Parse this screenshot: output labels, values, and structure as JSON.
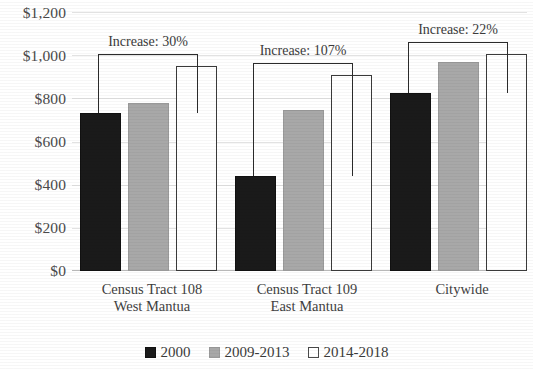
{
  "chart_data": {
    "type": "bar",
    "title": "",
    "subtitle": "",
    "xlabel": "",
    "ylabel": "",
    "ylim": [
      0,
      1200
    ],
    "ytick_step": 200,
    "ytick_labels": [
      "$0",
      "$200",
      "$400",
      "$600",
      "$800",
      "$1,000",
      "$1,200"
    ],
    "ytick_values": [
      0,
      200,
      400,
      600,
      800,
      1000,
      1200
    ],
    "grid": true,
    "legend_position": "bottom",
    "categories": [
      "Census Tract 108 West Mantua",
      "Census Tract 109 East Mantua",
      "Citywide"
    ],
    "category_lines": [
      [
        "Census Tract 108",
        "West Mantua"
      ],
      [
        "Census Tract 109",
        "East Mantua"
      ],
      [
        "Citywide",
        ""
      ]
    ],
    "series": [
      {
        "name": "2000",
        "color": "#1a1a1a",
        "values": [
          731,
          440,
          825
        ]
      },
      {
        "name": "2009-2013",
        "color": "#a8a8a8",
        "values": [
          778,
          744,
          967
        ]
      },
      {
        "name": "2014-2018",
        "color": "#ffffff",
        "values": [
          951,
          910,
          1005
        ]
      }
    ],
    "annotations": [
      {
        "label": "Increase: 30%",
        "group": 0,
        "from_series": "2000",
        "to_series": "2014-2018",
        "value": 30
      },
      {
        "label": "Increase: 107%",
        "group": 1,
        "from_series": "2000",
        "to_series": "2014-2018",
        "value": 107
      },
      {
        "label": "Increase: 22%",
        "group": 2,
        "from_series": "2000",
        "to_series": "2014-2018",
        "value": 22
      }
    ]
  },
  "axis": {
    "y_ticks": [
      {
        "label": "$1,200"
      },
      {
        "label": "$1,000"
      },
      {
        "label": "$800"
      },
      {
        "label": "$600"
      },
      {
        "label": "$400"
      },
      {
        "label": "$200"
      },
      {
        "label": "$0"
      }
    ]
  },
  "categories": [
    {
      "line1": "Census Tract 108",
      "line2": "West Mantua"
    },
    {
      "line1": "Census Tract 109",
      "line2": "East Mantua"
    },
    {
      "line1": "Citywide",
      "line2": ""
    }
  ],
  "annotations": [
    {
      "text": "Increase: 30%"
    },
    {
      "text": "Increase: 107%"
    },
    {
      "text": "Increase: 22%"
    }
  ],
  "legend": {
    "items": [
      {
        "label": "2000",
        "color": "#1a1a1a"
      },
      {
        "label": "2009-2013",
        "color": "#a8a8a8"
      },
      {
        "label": "2014-2018",
        "color": "#ffffff"
      }
    ]
  }
}
